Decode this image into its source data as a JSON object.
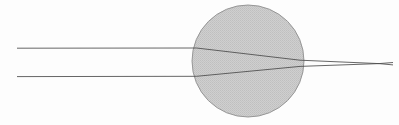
{
  "figure": {
    "width": 399,
    "height": 125,
    "background_color": "#fdfdfd"
  },
  "chart_data": {
    "type": "diagram",
    "subtitle": "",
    "xlabel": "",
    "ylabel": "",
    "xlim": [
      0,
      399
    ],
    "ylim": [
      0,
      125
    ],
    "grid": false,
    "legend": null,
    "annotations": [],
    "elements": [
      {
        "name": "sphere",
        "shape": "circle",
        "center": [
          248,
          61
        ],
        "radius": 56,
        "fill_color": "#c9c9c9",
        "stroke_color": "#8f8f8f",
        "stroke_width": 0.9
      },
      {
        "name": "upper-ray",
        "shape": "polyline",
        "points": [
          [
            17,
            48.2
          ],
          [
            196.5,
            48.0
          ],
          [
            300.0,
            60.2
          ],
          [
            379.0,
            63.6
          ],
          [
            393.0,
            64.9
          ]
        ],
        "stroke_color": "#4a4a4a",
        "stroke_width": 0.85
      },
      {
        "name": "lower-ray",
        "shape": "polyline",
        "points": [
          [
            17,
            76.6
          ],
          [
            196.5,
            76.3
          ],
          [
            300.0,
            66.4
          ],
          [
            379.0,
            63.6
          ],
          [
            393.0,
            62.5
          ]
        ],
        "stroke_color": "#4a4a4a",
        "stroke_width": 0.85
      }
    ],
    "focal_point": [
      379,
      63.6
    ],
    "incident_ray_heights": [
      48.2,
      76.6
    ],
    "series": [
      {
        "name": "upper-ray",
        "x": [
          17,
          196.5,
          300.0,
          379.0,
          393.0
        ],
        "y": [
          48.2,
          48.0,
          60.2,
          63.6,
          64.9
        ]
      },
      {
        "name": "lower-ray",
        "x": [
          17,
          196.5,
          300.0,
          379.0,
          393.0
        ],
        "y": [
          76.6,
          76.3,
          66.4,
          63.6,
          62.5
        ]
      }
    ]
  },
  "colors": {
    "sphere_fill": "#c9c9c9",
    "sphere_stroke": "#8f8f8f",
    "ray_stroke": "#4a4a4a",
    "background": "#fdfdfd"
  }
}
